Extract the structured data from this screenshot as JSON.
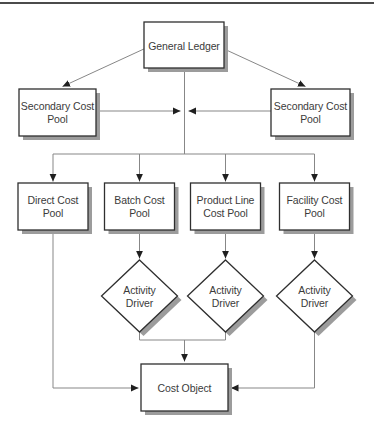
{
  "diagram": {
    "kind": "flowchart",
    "nodes": {
      "general_ledger": {
        "shape": "rect",
        "lines": [
          "General Ledger"
        ]
      },
      "secondary_cost_pool_left": {
        "shape": "rect",
        "lines": [
          "Secondary Cost",
          "Pool"
        ]
      },
      "secondary_cost_pool_right": {
        "shape": "rect",
        "lines": [
          "Secondary Cost",
          "Pool"
        ]
      },
      "direct_cost_pool": {
        "shape": "rect",
        "lines": [
          "Direct Cost",
          "Pool"
        ]
      },
      "batch_cost_pool": {
        "shape": "rect",
        "lines": [
          "Batch Cost",
          "Pool"
        ]
      },
      "product_line_cost_pool": {
        "shape": "rect",
        "lines": [
          "Product Line",
          "Cost Pool"
        ]
      },
      "facility_cost_pool": {
        "shape": "rect",
        "lines": [
          "Facility Cost",
          "Pool"
        ]
      },
      "activity_driver_1": {
        "shape": "diamond",
        "lines": [
          "Activity",
          "Driver"
        ]
      },
      "activity_driver_2": {
        "shape": "diamond",
        "lines": [
          "Activity",
          "Driver"
        ]
      },
      "activity_driver_3": {
        "shape": "diamond",
        "lines": [
          "Activity",
          "Driver"
        ]
      },
      "cost_object": {
        "shape": "rect",
        "lines": [
          "Cost Object"
        ]
      }
    },
    "edges": [
      {
        "from": "general_ledger",
        "to": "secondary_cost_pool_left",
        "arrow": true
      },
      {
        "from": "general_ledger",
        "to": "secondary_cost_pool_right",
        "arrow": true
      },
      {
        "from": "secondary_cost_pool_left",
        "to": "center-junction",
        "arrow": true
      },
      {
        "from": "secondary_cost_pool_right",
        "to": "center-junction",
        "arrow": true
      },
      {
        "from": "general_ledger",
        "to": "direct_cost_pool",
        "arrow": true
      },
      {
        "from": "general_ledger",
        "to": "batch_cost_pool",
        "arrow": true
      },
      {
        "from": "general_ledger",
        "to": "product_line_cost_pool",
        "arrow": true
      },
      {
        "from": "general_ledger",
        "to": "facility_cost_pool",
        "arrow": true
      },
      {
        "from": "batch_cost_pool",
        "to": "activity_driver_1",
        "arrow": true
      },
      {
        "from": "product_line_cost_pool",
        "to": "activity_driver_2",
        "arrow": true
      },
      {
        "from": "facility_cost_pool",
        "to": "activity_driver_3",
        "arrow": true
      },
      {
        "from": "activity_driver_1",
        "to": "cost_object",
        "arrow": true
      },
      {
        "from": "activity_driver_2",
        "to": "cost_object",
        "arrow": true
      },
      {
        "from": "activity_driver_3",
        "to": "cost_object",
        "arrow": true
      },
      {
        "from": "direct_cost_pool",
        "to": "cost_object",
        "arrow": true
      }
    ],
    "colors": {
      "background": "#ffffff",
      "box_fill": "#ffffff",
      "box_border": "#2f2f2f",
      "drop_shadow": "#9c9c9c",
      "connector_line": "#878787",
      "arrowhead": "#1f1f1f",
      "text": "#3b3b3b",
      "top_rule": "#4b4b4b"
    }
  }
}
